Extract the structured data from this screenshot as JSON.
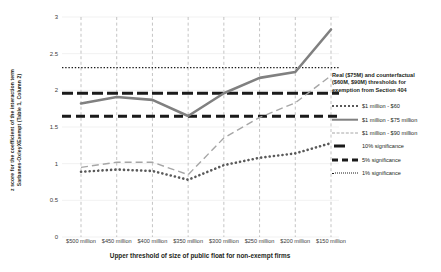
{
  "chart_data": {
    "type": "line",
    "title": "",
    "xlabel": "Upper threshold of size of public float for non-exempt firms",
    "ylabel": "z score for the coefficient of the interaction term Sarbanes-OxleyXExempt (Table 1, Column 2)",
    "ylabel_line1": "z score for the coefficient of the interaction term",
    "ylabel_line2": "Sarbanes-OxleyXExempt (Table 1, Column 2)",
    "categories": [
      "$500 million",
      "$450 million",
      "$400 million",
      "$350 million",
      "$300 million",
      "$250 million",
      "$200 million",
      "$150 million"
    ],
    "ylim": [
      0,
      3
    ],
    "yticks": [
      0,
      0.5,
      1,
      1.5,
      2,
      2.5,
      3
    ],
    "ytick_labels": [
      "0",
      "0.5",
      "1",
      "1.5",
      "2",
      "2.5",
      "3"
    ],
    "grid": "vertical-dashed",
    "legend_position": "right",
    "series": [
      {
        "name": "$1 million - $60",
        "style": "dotted",
        "color": "#595959",
        "values": [
          0.89,
          0.92,
          0.9,
          0.78,
          0.98,
          1.08,
          1.14,
          1.28
        ]
      },
      {
        "name": "$1 million - $75 million",
        "style": "solid",
        "color": "#808080",
        "values": [
          1.82,
          1.91,
          1.87,
          1.65,
          1.96,
          2.17,
          2.25,
          2.83
        ]
      },
      {
        "name": "$1 million - $90 million",
        "style": "dashed",
        "color": "#a6a6a6",
        "values": [
          0.95,
          1.02,
          1.02,
          0.85,
          1.35,
          1.63,
          1.83,
          2.2
        ]
      }
    ],
    "threshold_lines": [
      {
        "name": "10% significance",
        "value": 1.645,
        "style": "thick-dash",
        "color": "#1a1a1a"
      },
      {
        "name": "5% significance",
        "value": 1.96,
        "style": "thick-dash-long",
        "color": "#1a1a1a"
      },
      {
        "name": "1% significance",
        "value": 2.31,
        "style": "fine-dotted",
        "color": "#1a1a1a"
      }
    ]
  },
  "legend": {
    "title": "Real ($75M) and counterfactual ($60M, $90M) thresholds for exemption from Section 404",
    "title_lines": [
      "Real ($75M) and counterfactual",
      "($60M, $90M) thresholds for",
      "exemption from Section 404"
    ],
    "items": [
      {
        "label": "$1 million - $60",
        "key": "dotted-marker-key"
      },
      {
        "label": "$1 million - $75 million",
        "key": "solid-line-key"
      },
      {
        "label": "$1 million - $90 million",
        "key": "dashed-line-key"
      },
      {
        "label": "10% significance",
        "key": "thick-dash-key"
      },
      {
        "label": "5% significance",
        "key": "thick-dash-long-key"
      },
      {
        "label": "1% significance",
        "key": "fine-dotted-key"
      }
    ]
  },
  "colors": {
    "series_75m": "#808080",
    "series_90m": "#a6a6a6",
    "series_60m": "#595959",
    "significance": "#1a1a1a",
    "gridline": "#a9a9a9",
    "background": "#ffffff"
  }
}
